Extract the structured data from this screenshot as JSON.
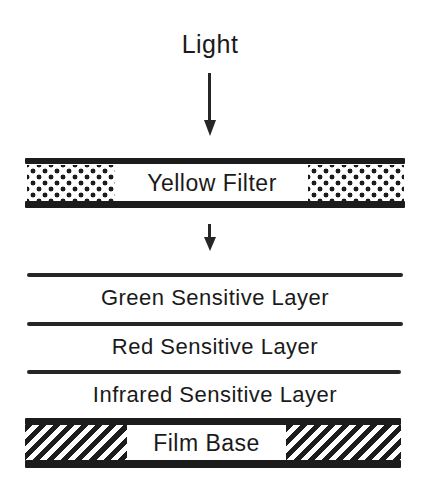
{
  "diagram": {
    "light_label": "Light",
    "yellow_filter": {
      "label": "Yellow Filter",
      "pattern": "dotted"
    },
    "layers": [
      {
        "label": "Green Sensitive Layer"
      },
      {
        "label": "Red Sensitive Layer"
      },
      {
        "label": "Infrared Sensitive Layer"
      }
    ],
    "film_base": {
      "label": "Film Base",
      "pattern": "diagonal-hatch"
    },
    "arrows": [
      {
        "direction": "down",
        "from": "Light",
        "to": "Yellow Filter"
      },
      {
        "direction": "down",
        "from": "Yellow Filter",
        "to": "Green Sensitive Layer"
      }
    ],
    "colors": {
      "ink": "#1c1c1c",
      "background": "#ffffff"
    }
  }
}
